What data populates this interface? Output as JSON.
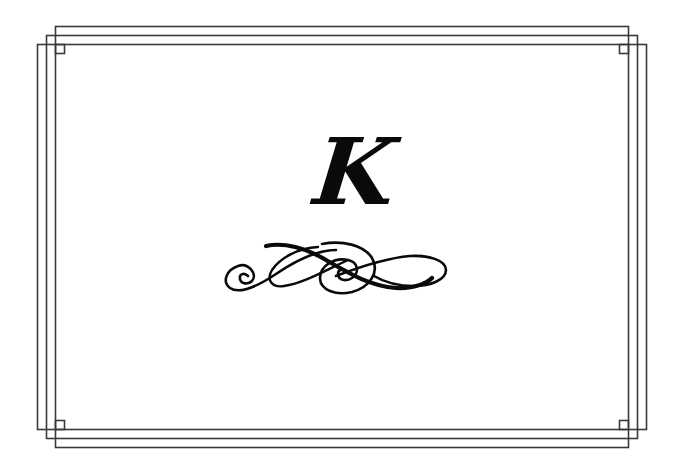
{
  "card": {
    "monogram_letter": "K",
    "ink_color": "#0a0a0a",
    "frame_color": "#3a3a3a",
    "background_color": "#ffffff"
  },
  "decorations": {
    "frame": "triple-interlaced-rectangle-border",
    "corner_ornaments": [
      "top-left-square",
      "top-right-square",
      "bottom-left-square",
      "bottom-right-square"
    ],
    "divider": "calligraphic-flourish"
  }
}
